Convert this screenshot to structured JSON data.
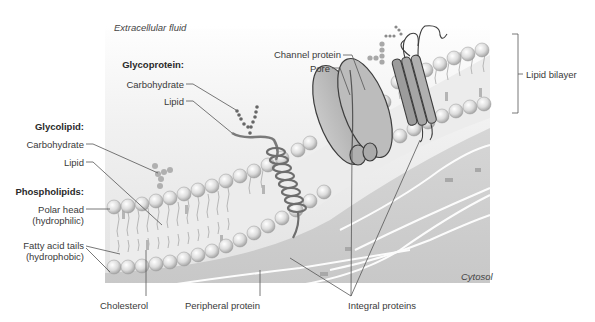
{
  "diagram": {
    "regions": {
      "extracellular": "Extracellular fluid",
      "cytosol": "Cytosol"
    },
    "groups": [
      {
        "heading": "Glycoprotein:",
        "items": [
          "Carbohydrate",
          "Lipid"
        ]
      },
      {
        "heading": "Glycolipid:",
        "items": [
          "Carbohydrate",
          "Lipid"
        ]
      },
      {
        "heading": "Phospholipids:",
        "items": [
          "Polar head",
          "(hydrophilic)",
          "Fatty acid tails",
          "(hydrophobic)"
        ]
      }
    ],
    "labels": {
      "channel_protein": "Channel protein",
      "pore": "Pore",
      "lipid_bilayer": "Lipid bilayer",
      "cholesterol": "Cholesterol",
      "peripheral_protein": "Peripheral protein",
      "integral_proteins": "Integral proteins"
    },
    "colors": {
      "background": "#ffffff",
      "membrane_gradient_top": "#f4f4f4",
      "cytosol_fill": "#cfcfcf",
      "head_fill": "#e6e6e6",
      "head_stroke": "#9a9a9a",
      "protein_fill": "#b9b9b9",
      "protein_stroke": "#3d3d3d",
      "leader_line": "#555555",
      "filament": "#ffffff"
    }
  }
}
